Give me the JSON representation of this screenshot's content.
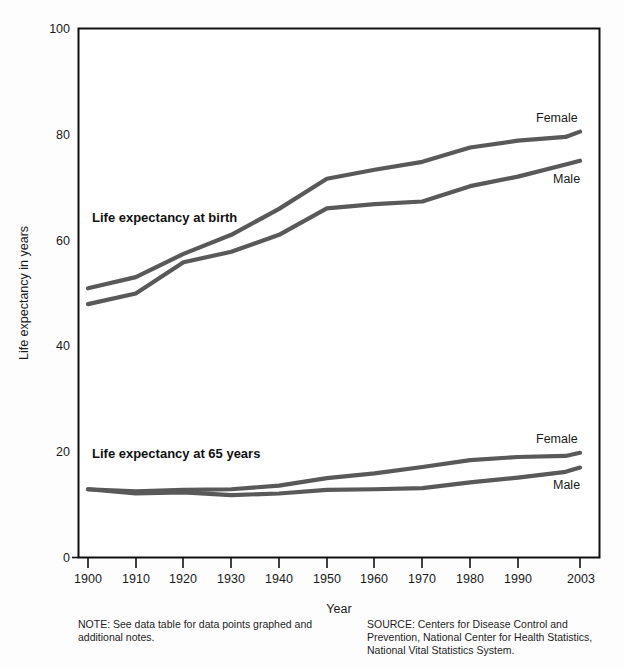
{
  "chart_data": {
    "type": "line",
    "title": "",
    "xlabel": "Year",
    "ylabel": "Life expectancy in years",
    "ylim": [
      0,
      100
    ],
    "yticks": [
      0,
      20,
      40,
      60,
      80,
      100
    ],
    "xlim": [
      1900,
      2003
    ],
    "xticks": [
      1900,
      1910,
      1920,
      1930,
      1940,
      1950,
      1960,
      1970,
      1980,
      1990,
      2003
    ],
    "xticklabels": [
      "1900",
      "1910",
      "1920",
      "1930",
      "1940",
      "1950",
      "1960",
      "1970",
      "1980",
      "1990",
      "2003"
    ],
    "grid": false,
    "legend_position": "inline-right-of-line-ends",
    "group_labels": [
      {
        "id": "birth",
        "text": "Life expectancy at birth",
        "x": 1902,
        "y": 64.5
      },
      {
        "id": "at65",
        "text": "Life expectancy at 65 years",
        "x": 1902,
        "y": 18.6
      }
    ],
    "series": [
      {
        "name": "Female",
        "group": "Life expectancy at birth",
        "label": "Female",
        "color": "#595959",
        "x": [
          1900,
          1910,
          1920,
          1930,
          1940,
          1950,
          1960,
          1970,
          1980,
          1990,
          2000,
          2003
        ],
        "values": [
          50.9,
          53.0,
          57.4,
          61.0,
          65.9,
          71.6,
          73.3,
          74.8,
          77.5,
          78.8,
          79.5,
          80.5
        ]
      },
      {
        "name": "Male",
        "group": "Life expectancy at birth",
        "label": "Male",
        "color": "#595959",
        "x": [
          1900,
          1910,
          1920,
          1930,
          1940,
          1950,
          1960,
          1970,
          1980,
          1990,
          2000,
          2003
        ],
        "values": [
          47.9,
          49.9,
          55.8,
          57.8,
          61.0,
          66.0,
          66.8,
          67.3,
          70.2,
          72.0,
          74.3,
          75.0
        ]
      },
      {
        "name": "Female 65",
        "group": "Life expectancy at 65 years",
        "label": "Female",
        "color": "#595959",
        "x": [
          1900,
          1910,
          1920,
          1930,
          1940,
          1950,
          1960,
          1970,
          1980,
          1990,
          2000,
          2003
        ],
        "values": [
          12.9,
          12.5,
          12.8,
          12.9,
          13.6,
          15.0,
          15.9,
          17.1,
          18.4,
          19.0,
          19.2,
          19.8
        ]
      },
      {
        "name": "Male 65",
        "group": "Life expectancy at 65 years",
        "label": "Male",
        "color": "#595959",
        "x": [
          1900,
          1910,
          1920,
          1930,
          1940,
          1950,
          1960,
          1970,
          1980,
          1990,
          2000,
          2003
        ],
        "values": [
          12.9,
          12.1,
          12.3,
          11.8,
          12.1,
          12.8,
          12.9,
          13.1,
          14.2,
          15.1,
          16.2,
          17.0
        ]
      }
    ]
  },
  "labels": {
    "y_axis_title": "Life expectancy in years",
    "x_axis_title": "Year",
    "y_100": "100",
    "y_80": "80",
    "y_60": "60",
    "y_40": "40",
    "y_20": "20",
    "y_0": "0",
    "x_1900": "1900",
    "x_1910": "1910",
    "x_1920": "1920",
    "x_1930": "1930",
    "x_1940": "1940",
    "x_1950": "1950",
    "x_1960": "1960",
    "x_1970": "1970",
    "x_1980": "1980",
    "x_1990": "1990",
    "x_2003": "2003",
    "birth_group": "Life expectancy at birth",
    "at65_group": "Life expectancy at 65 years",
    "birth_female": "Female",
    "birth_male": "Male",
    "at65_female": "Female",
    "at65_male": "Male"
  },
  "footnotes": {
    "note": "NOTE: See data table for data points graphed and additional notes.",
    "source": "SOURCE: Centers for Disease Control and Prevention, National Center for Health Statistics, National Vital Statistics System."
  }
}
